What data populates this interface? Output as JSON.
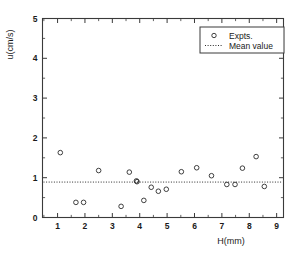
{
  "chart_data": {
    "type": "scatter",
    "title": "",
    "xlabel": "H(mm)",
    "ylabel": "u(cm/s)",
    "xlim": [
      0.45,
      9.25
    ],
    "ylim": [
      0,
      5
    ],
    "xticks": [
      1,
      2,
      3,
      4,
      5,
      6,
      7,
      8,
      9
    ],
    "yticks": [
      0,
      1,
      2,
      3,
      4,
      5
    ],
    "xtick_labels": [
      "1",
      "2",
      "3",
      "4",
      "5",
      "6",
      "7",
      "8",
      "9"
    ],
    "ytick_labels": [
      "0",
      "1",
      "2",
      "3",
      "4",
      "5"
    ],
    "minor_ticks": true,
    "minor_tick_step": 0.5,
    "grid": false,
    "legend_position": "top-right",
    "series": [
      {
        "name": "Expts.",
        "marker": "open-circle",
        "color": "#2b2b2b",
        "x": [
          1.1,
          1.67,
          1.95,
          2.5,
          3.32,
          3.62,
          3.88,
          3.9,
          4.15,
          4.42,
          4.68,
          4.97,
          5.52,
          6.08,
          6.62,
          7.18,
          7.48,
          7.75,
          8.25,
          8.55
        ],
        "y": [
          1.63,
          0.38,
          0.38,
          1.18,
          0.28,
          1.14,
          0.92,
          0.9,
          0.43,
          0.76,
          0.66,
          0.71,
          1.15,
          1.25,
          1.05,
          0.83,
          0.83,
          1.24,
          1.53,
          0.78
        ]
      },
      {
        "name": "Mean value",
        "marker": "dash-dot-line",
        "color": "#2b2b2b",
        "value": 0.89
      }
    ],
    "legend": [
      {
        "label": "Expts.",
        "marker": "open-circle"
      },
      {
        "label": "Mean value",
        "marker": "dash-dot-line"
      }
    ]
  },
  "colors": {
    "axis": "#3a3a3a",
    "marker": "#2b2b2b",
    "text": "#1a1a1a",
    "background": "#ffffff"
  }
}
